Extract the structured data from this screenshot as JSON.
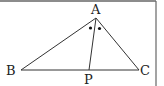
{
  "figure": {
    "type": "geometry-triangle",
    "labels": {
      "A": "A",
      "B": "B",
      "C": "C",
      "P": "P"
    },
    "points": {
      "A": [
        96,
        18
      ],
      "B": [
        21,
        70
      ],
      "C": [
        139,
        70
      ],
      "P": [
        89,
        70
      ]
    },
    "segments": [
      "AB",
      "AC",
      "BC",
      "AP"
    ],
    "angle_marks": {
      "vertex": "A",
      "marks": 2,
      "style": "dot",
      "meaning": "equal angles BAP and PAC"
    },
    "colors": {
      "line": "#333333",
      "border": "#555555",
      "background": "#ffffff"
    }
  }
}
